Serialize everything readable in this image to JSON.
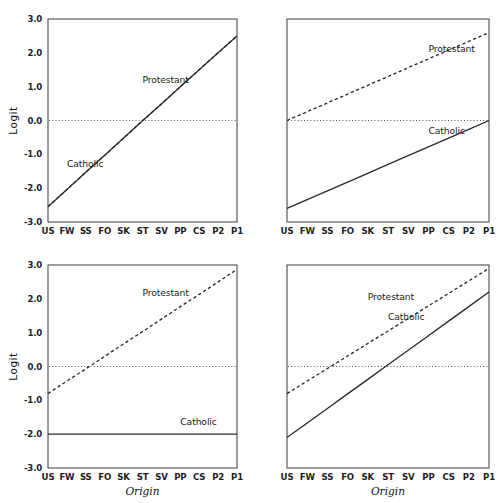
{
  "figure": {
    "width": 500,
    "height": 503,
    "background": "#ffffff",
    "line_color": "#2b2b2b",
    "axis_color": "#4d4d4d",
    "reference_line_color": "#555555"
  },
  "chart_data": [
    {
      "id": "panel-top-left",
      "type": "line",
      "title": "",
      "xlabel": "",
      "ylabel": "Logit",
      "categories": [
        "US",
        "FW",
        "SS",
        "FO",
        "SK",
        "ST",
        "SV",
        "PP",
        "CS",
        "P2",
        "P1"
      ],
      "ylim": [
        -3.0,
        3.0
      ],
      "yticks": [
        3.0,
        2.0,
        1.0,
        0.0,
        -1.0,
        -2.0,
        -3.0
      ],
      "ytick_labels": [
        "3.0",
        "2.0",
        "1.0",
        "0.0",
        "-1.0",
        "-2.0",
        "-3.0"
      ],
      "grid": false,
      "legend_position": "inline-annotation",
      "reference_line": {
        "y": 0.0,
        "style": "dotted"
      },
      "series": [
        {
          "name": "Protestant",
          "style": "dashed",
          "values": [
            -2.55,
            -2.04,
            -1.53,
            -1.03,
            -0.52,
            -0.01,
            0.49,
            1.0,
            1.5,
            2.0,
            2.5
          ],
          "label_x_category": "ST",
          "label_y": 1.1
        },
        {
          "name": "Catholic",
          "style": "solid",
          "values": [
            -2.55,
            -2.04,
            -1.53,
            -1.03,
            -0.52,
            -0.01,
            0.49,
            1.0,
            1.5,
            2.0,
            2.5
          ],
          "label_x_category": "FW",
          "label_y": -1.38
        }
      ],
      "annotations": [
        {
          "text": "Protestant",
          "x_category": "ST",
          "y": 1.1
        },
        {
          "text": "Catholic",
          "x_category": "FW",
          "y": -1.38
        }
      ]
    },
    {
      "id": "panel-top-right",
      "type": "line",
      "title": "",
      "xlabel": "",
      "ylabel": "",
      "categories": [
        "US",
        "FW",
        "SS",
        "FO",
        "SK",
        "ST",
        "SV",
        "PP",
        "CS",
        "P2",
        "P1"
      ],
      "ylim": [
        -3.0,
        3.0
      ],
      "yticks": [
        3.0,
        2.0,
        1.0,
        0.0,
        -1.0,
        -2.0,
        -3.0
      ],
      "ytick_labels": [],
      "grid": false,
      "legend_position": "inline-annotation",
      "reference_line": {
        "y": 0.0,
        "style": "dotted"
      },
      "series": [
        {
          "name": "Protestant",
          "style": "dashed",
          "values": [
            0.0,
            0.26,
            0.52,
            0.78,
            1.04,
            1.3,
            1.56,
            1.82,
            2.08,
            2.34,
            2.6
          ],
          "label_x_category": "PP",
          "label_y": 2.02
        },
        {
          "name": "Catholic",
          "style": "solid",
          "values": [
            -2.6,
            -2.34,
            -2.08,
            -1.82,
            -1.56,
            -1.3,
            -1.04,
            -0.78,
            -0.52,
            -0.26,
            0.0
          ],
          "label_x_category": "PP",
          "label_y": -0.4
        }
      ],
      "annotations": [
        {
          "text": "Protestant",
          "x_category": "PP",
          "y": 2.02
        },
        {
          "text": "Catholic",
          "x_category": "PP",
          "y": -0.4
        }
      ]
    },
    {
      "id": "panel-bottom-left",
      "type": "line",
      "title": "",
      "xlabel": "Origin",
      "ylabel": "Logit",
      "categories": [
        "US",
        "FW",
        "SS",
        "FO",
        "SK",
        "ST",
        "SV",
        "PP",
        "CS",
        "P2",
        "P1"
      ],
      "ylim": [
        -3.0,
        3.0
      ],
      "yticks": [
        3.0,
        2.0,
        1.0,
        0.0,
        -1.0,
        -2.0,
        -3.0
      ],
      "ytick_labels": [
        "3.0",
        "2.0",
        "1.0",
        "0.0",
        "-1.0",
        "-2.0",
        "-3.0"
      ],
      "grid": false,
      "legend_position": "inline-annotation",
      "reference_line": {
        "y": 0.0,
        "style": "dotted"
      },
      "series": [
        {
          "name": "Protestant",
          "style": "dashed",
          "values": [
            -0.8,
            -0.43,
            -0.07,
            0.3,
            0.67,
            1.03,
            1.4,
            1.77,
            2.13,
            2.5,
            2.87
          ],
          "label_x_category": "ST",
          "label_y": 2.08
        },
        {
          "name": "Catholic",
          "style": "solid",
          "values": [
            -2.0,
            -2.0,
            -2.0,
            -2.0,
            -2.0,
            -2.0,
            -2.0,
            -2.0,
            -2.0,
            -2.0,
            -2.0
          ],
          "label_x_category": "PP",
          "label_y": -1.72
        }
      ],
      "annotations": [
        {
          "text": "Protestant",
          "x_category": "ST",
          "y": 2.08
        },
        {
          "text": "Catholic",
          "x_category": "PP",
          "y": -1.72
        }
      ]
    },
    {
      "id": "panel-bottom-right",
      "type": "line",
      "title": "",
      "xlabel": "Origin",
      "ylabel": "",
      "categories": [
        "US",
        "FW",
        "SS",
        "FO",
        "SK",
        "ST",
        "SV",
        "PP",
        "CS",
        "P2",
        "P1"
      ],
      "ylim": [
        -3.0,
        3.0
      ],
      "yticks": [
        3.0,
        2.0,
        1.0,
        0.0,
        -1.0,
        -2.0,
        -3.0
      ],
      "ytick_labels": [],
      "grid": false,
      "legend_position": "inline-annotation",
      "reference_line": {
        "y": 0.0,
        "style": "dotted"
      },
      "series": [
        {
          "name": "Protestant",
          "style": "dashed",
          "values": [
            -0.8,
            -0.43,
            -0.06,
            0.31,
            0.68,
            1.05,
            1.42,
            1.79,
            2.16,
            2.53,
            2.9
          ],
          "label_x_category": "SK",
          "label_y": 1.96
        },
        {
          "name": "Catholic",
          "style": "solid",
          "values": [
            -2.1,
            -1.67,
            -1.24,
            -0.81,
            -0.38,
            0.05,
            0.48,
            0.91,
            1.34,
            1.77,
            2.2
          ],
          "label_x_category": "ST",
          "label_y": 1.36
        }
      ],
      "annotations": [
        {
          "text": "Protestant",
          "x_category": "SK",
          "y": 1.96
        },
        {
          "text": "Catholic",
          "x_category": "ST",
          "y": 1.36
        }
      ]
    }
  ],
  "labels": {
    "ylabel": "Logit",
    "xlabel": "Origin",
    "protestant": "Protestant",
    "catholic": "Catholic"
  }
}
